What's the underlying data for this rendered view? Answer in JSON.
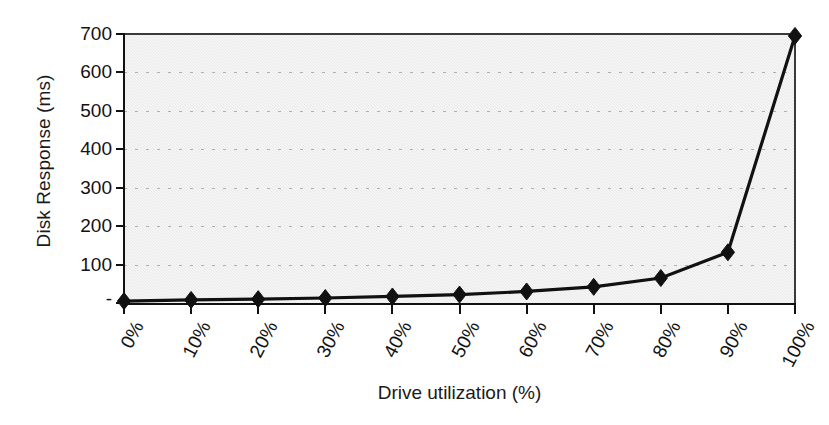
{
  "chart_data": {
    "type": "line",
    "title": "",
    "xlabel": "Drive utilization (%)",
    "ylabel": "Disk Response (ms)",
    "categories": [
      "0%",
      "10%",
      "20%",
      "30%",
      "40%",
      "50%",
      "60%",
      "70%",
      "80%",
      "90%",
      "100%"
    ],
    "x": [
      0,
      10,
      20,
      30,
      40,
      50,
      60,
      70,
      80,
      90,
      100
    ],
    "values": [
      5,
      8,
      10,
      13,
      17,
      22,
      30,
      42,
      65,
      132,
      695
    ],
    "series": [
      {
        "name": "Disk Response",
        "values": [
          5,
          8,
          10,
          13,
          17,
          22,
          30,
          42,
          65,
          132,
          695
        ]
      }
    ],
    "ylim": [
      0,
      700
    ],
    "ytick_values": [
      0,
      100,
      200,
      300,
      400,
      500,
      600,
      700
    ],
    "ytick_labels": [
      "-",
      "100",
      "200",
      "300",
      "400",
      "500",
      "600",
      "700"
    ],
    "xlim": [
      0,
      100
    ],
    "grid": true,
    "grid_axis": "y",
    "grid_style": "dotted",
    "legend": false,
    "legend_position": "none",
    "marker": "diamond",
    "marker_color": "#111111",
    "line_color": "#111111",
    "plot_background": "#e9e9e9",
    "page_background": "#ffffff"
  },
  "axes": {
    "y_title": "Disk Response (ms)",
    "x_title": "Drive utilization (%)"
  }
}
